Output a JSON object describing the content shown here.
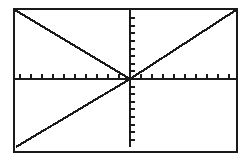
{
  "graph": {
    "title": "",
    "description": "Graphing calculator plot window showing two straight lines through the origin",
    "background_color": "#ffffff",
    "ink_color": "#1a1a1a",
    "frame": {
      "name": "plot-frame",
      "x": 14,
      "y": 9,
      "width": 223,
      "height": 143,
      "stroke_width": 2.2
    },
    "axes": {
      "x_axis": {
        "label": "x",
        "y_pixel": 79,
        "x_start": 15,
        "x_end": 236,
        "stroke_width": 2.4,
        "tick_spacing": 11,
        "tick_length": 5,
        "tick_direction": "up",
        "tick_count": 21
      },
      "y_axis": {
        "label": "y",
        "x_pixel": 130,
        "y_start": 10,
        "y_end": 147,
        "stroke_width": 2.4,
        "tick_spacing": 7.6,
        "tick_length": 5,
        "tick_direction": "right",
        "tick_count": 18
      },
      "origin": {
        "x": 130,
        "y": 79
      }
    }
  },
  "chart_data": {
    "type": "line",
    "title": "",
    "xlabel": "x",
    "ylabel": "y",
    "grid": false,
    "legend": "none",
    "xlim": [
      -10.5,
      9.7
    ],
    "ylim": [
      -9.2,
      9.0
    ],
    "origin_pixel": [
      130,
      79
    ],
    "pixels_per_unit_x": 11,
    "pixels_per_unit_y": 7.6,
    "series": [
      {
        "name": "descending-line",
        "comment": "Line of negative slope drawn only for x less than 0, from top-left corner of window down to the origin",
        "slope": -0.86,
        "intercept": 0,
        "x": [
          -10.45,
          0
        ],
        "y": [
          9.0,
          0
        ],
        "pixel_points": [
          [
            15,
            10
          ],
          [
            130,
            79
          ]
        ],
        "stroke_width": 2.2,
        "color": "#1a1a1a"
      },
      {
        "name": "ascending-line",
        "comment": "Line of positive slope through the origin, from bottom-left corner of window to top-right corner",
        "slope": 0.83,
        "intercept": 0,
        "x": [
          -10.45,
          0,
          9.65
        ],
        "y": [
          -8.95,
          0,
          9.0
        ],
        "pixel_points": [
          [
            16,
            147
          ],
          [
            130,
            79
          ],
          [
            236,
            10
          ]
        ],
        "stroke_width": 2.2,
        "color": "#1a1a1a"
      }
    ]
  }
}
